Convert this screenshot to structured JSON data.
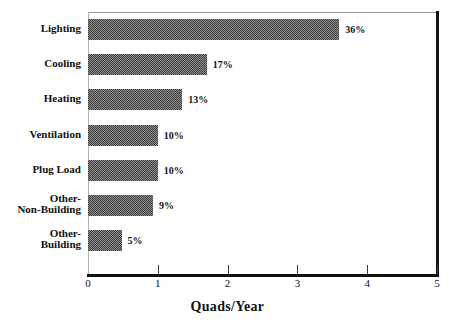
{
  "chart_data": {
    "type": "bar",
    "orientation": "horizontal",
    "title": "",
    "xlabel": "Quads/Year",
    "ylabel": "",
    "xlim": [
      0,
      5
    ],
    "xticks": [
      "0",
      "1",
      "2",
      "3",
      "4",
      "5"
    ],
    "grid": false,
    "legend": false,
    "categories": [
      "Lighting",
      "Cooling",
      "Heating",
      "Ventilation",
      "Plug Load",
      "Other-Non-Building",
      "Other-Building"
    ],
    "values": [
      3.6,
      1.7,
      1.35,
      1.0,
      1.0,
      0.93,
      0.48
    ],
    "data_labels": [
      "36%",
      "17%",
      "13%",
      "10%",
      "10%",
      "9%",
      "5%"
    ],
    "bars": [
      {
        "label_lines": [
          "Lighting"
        ],
        "value": 3.6,
        "data_label": "36%"
      },
      {
        "label_lines": [
          "Cooling"
        ],
        "value": 1.7,
        "data_label": "17%"
      },
      {
        "label_lines": [
          "Heating"
        ],
        "value": 1.35,
        "data_label": "13%"
      },
      {
        "label_lines": [
          "Ventilation"
        ],
        "value": 1.0,
        "data_label": "10%"
      },
      {
        "label_lines": [
          "Plug Load"
        ],
        "value": 1.0,
        "data_label": "10%"
      },
      {
        "label_lines": [
          "Other-",
          "Non-Building"
        ],
        "value": 0.93,
        "data_label": "9%"
      },
      {
        "label_lines": [
          "Other-",
          "Building"
        ],
        "value": 0.48,
        "data_label": "5%"
      }
    ],
    "colors": {
      "bar_fill": "#8d8d8d",
      "bar_pattern": "#3f3f3f",
      "axis": "#111111",
      "text": "#111111",
      "background": "#ffffff"
    }
  }
}
